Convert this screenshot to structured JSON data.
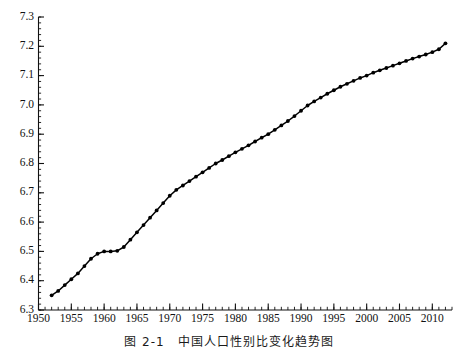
{
  "chart_data": {
    "type": "line",
    "title": "",
    "subtitle": "",
    "xlabel": "",
    "ylabel": "",
    "xlim": [
      1950,
      2013
    ],
    "ylim": [
      6.3,
      7.3
    ],
    "grid": false,
    "legend": null,
    "legend_position": "none",
    "marker": "filled-circle",
    "line_color": "#000000",
    "marker_color": "#000000",
    "x_ticks_major": [
      1950,
      1955,
      1960,
      1965,
      1970,
      1975,
      1980,
      1985,
      1990,
      1995,
      2000,
      2005,
      2010
    ],
    "x_tick_labels": [
      "1950",
      "1955",
      "1960",
      "1965",
      "1970",
      "1975",
      "1980",
      "1985",
      "1990",
      "1995",
      "2000",
      "2005",
      "2010"
    ],
    "x_minor_tick_step": 1,
    "y_ticks_major": [
      6.3,
      6.4,
      6.5,
      6.6,
      6.7,
      6.8,
      6.9,
      7.0,
      7.1,
      7.2,
      7.3
    ],
    "y_tick_labels": [
      "6.3",
      "6.4",
      "6.5",
      "6.6",
      "6.7",
      "6.8",
      "6.9",
      "7.0",
      "7.1",
      "7.2",
      "7.3"
    ],
    "y_minor_tick_step": 0.02,
    "x": [
      1952,
      1953,
      1954,
      1955,
      1956,
      1957,
      1958,
      1959,
      1960,
      1961,
      1962,
      1963,
      1964,
      1965,
      1966,
      1967,
      1968,
      1969,
      1970,
      1971,
      1972,
      1973,
      1974,
      1975,
      1976,
      1977,
      1978,
      1979,
      1980,
      1981,
      1982,
      1983,
      1984,
      1985,
      1986,
      1987,
      1988,
      1989,
      1990,
      1991,
      1992,
      1993,
      1994,
      1995,
      1996,
      1997,
      1998,
      1999,
      2000,
      2001,
      2002,
      2003,
      2004,
      2005,
      2006,
      2007,
      2008,
      2009,
      2010,
      2011,
      2012
    ],
    "values": [
      6.35,
      6.365,
      6.385,
      6.405,
      6.425,
      6.45,
      6.475,
      6.492,
      6.5,
      6.5,
      6.502,
      6.515,
      6.54,
      6.565,
      6.59,
      6.615,
      6.64,
      6.665,
      6.69,
      6.71,
      6.725,
      6.74,
      6.755,
      6.77,
      6.785,
      6.8,
      6.812,
      6.825,
      6.838,
      6.85,
      6.862,
      6.875,
      6.888,
      6.9,
      6.915,
      6.93,
      6.945,
      6.962,
      6.98,
      6.998,
      7.012,
      7.025,
      7.038,
      7.05,
      7.062,
      7.072,
      7.082,
      7.092,
      7.1,
      7.11,
      7.118,
      7.126,
      7.134,
      7.142,
      7.15,
      7.158,
      7.165,
      7.172,
      7.18,
      7.19,
      7.21
    ],
    "annotations": []
  },
  "caption": {
    "text": "图 2-1　中国人口性别比变化趋势图",
    "visible_fragment": true
  }
}
